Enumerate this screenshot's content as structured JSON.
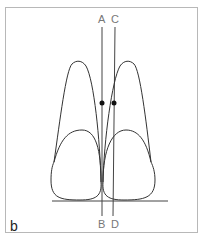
{
  "figure": {
    "panel_label": "b",
    "line_labels": {
      "top_left": "A",
      "top_right": "C",
      "bottom_left": "B",
      "bottom_right": "D"
    },
    "colors": {
      "stroke": "#333333",
      "frame": "#b8b8b8",
      "label": "#777777"
    }
  }
}
